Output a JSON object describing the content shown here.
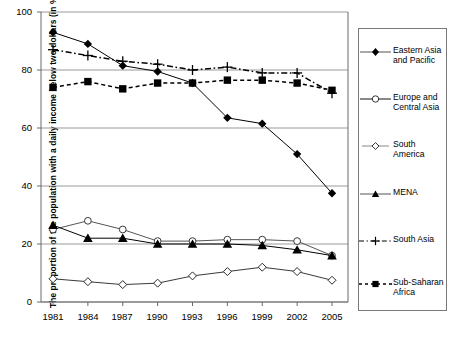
{
  "chart_data": {
    "type": "line",
    "title": "",
    "xlabel": "",
    "ylabel": "The proportion of the population with a daily income below two dollars (in %)",
    "categories": [
      "1981",
      "1984",
      "1987",
      "1990",
      "1993",
      "1996",
      "1999",
      "2002",
      "2005"
    ],
    "ylim": [
      0,
      100
    ],
    "yticks": [
      "0",
      "20",
      "40",
      "60",
      "80",
      "100"
    ],
    "grid": true,
    "legend_position": "right",
    "series": [
      {
        "name": "Eastern Asia and Pacific",
        "marker": "filled-diamond",
        "linestyle": "solid",
        "color": "#000000",
        "values": [
          93,
          89,
          81.5,
          79.5,
          75.5,
          63.5,
          61.5,
          51,
          37.5
        ]
      },
      {
        "name": "Europe and Central Asia",
        "marker": "open-circle",
        "linestyle": "solid",
        "color": "#555555",
        "values": [
          25,
          28,
          25,
          21,
          21,
          21.5,
          21.5,
          21,
          16
        ]
      },
      {
        "name": "South America",
        "marker": "open-diamond",
        "linestyle": "solid",
        "color": "#3a3a3a",
        "values": [
          8,
          7,
          6,
          6.5,
          9,
          10.5,
          12,
          10.5,
          7.5
        ]
      },
      {
        "name": "MENA",
        "marker": "filled-triangle",
        "linestyle": "solid",
        "color": "#000000",
        "values": [
          26.5,
          22,
          22,
          20,
          20,
          20,
          19.5,
          18,
          16
        ]
      },
      {
        "name": "South Asia",
        "marker": "plus",
        "linestyle": "dash-dot",
        "color": "#000000",
        "values": [
          87,
          85,
          83,
          82,
          80,
          81,
          79,
          79,
          72
        ]
      },
      {
        "name": "Sub-Saharan Africa",
        "marker": "filled-square",
        "linestyle": "dashed",
        "color": "#000000",
        "values": [
          74,
          76,
          73.5,
          75.5,
          75.5,
          76.5,
          76.5,
          75.5,
          73
        ]
      }
    ]
  },
  "legend": {
    "items": [
      {
        "label_line1": "Eastern Asia",
        "label_line2": "and Pacific"
      },
      {
        "label_line1": "Europe and",
        "label_line2": "Central Asia"
      },
      {
        "label_line1": "South",
        "label_line2": "America"
      },
      {
        "label_line1": "MENA",
        "label_line2": ""
      },
      {
        "label_line1": "South Asia",
        "label_line2": ""
      },
      {
        "label_line1": "Sub-Saharan",
        "label_line2": "Africa"
      }
    ]
  }
}
